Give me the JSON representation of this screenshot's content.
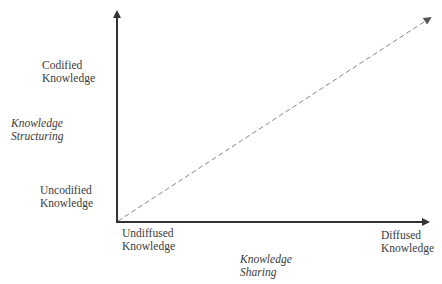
{
  "diagram": {
    "y_axis": {
      "title_line1": "Knowledge",
      "title_line2": "Structuring",
      "top_label_line1": "Codified",
      "top_label_line2": "Knowledge",
      "bottom_label_line1": "Uncodified",
      "bottom_label_line2": "Knowledge"
    },
    "x_axis": {
      "title_line1": "Knowledge",
      "title_line2": "Sharing",
      "left_label_line1": "Undiffused",
      "left_label_line2": "Knowledge",
      "right_label_line1": "Diffused",
      "right_label_line2": "Knowledge"
    },
    "diagonal": {
      "style": "dashed",
      "from": "Undiffused / Uncodified",
      "to": "Diffused / Codified"
    },
    "colors": {
      "axis": "#333333",
      "dashed": "#888888",
      "text": "#3a3a3a"
    }
  }
}
